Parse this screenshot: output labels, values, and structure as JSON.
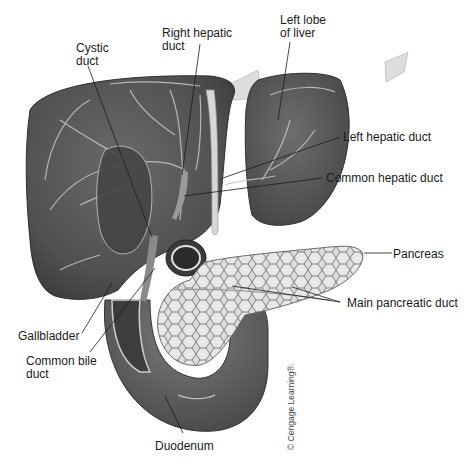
{
  "figure": {
    "colors": {
      "organ_dark": "#4a4a4a",
      "organ_mid": "#5e5e5e",
      "organ_light": "#7a7a7a",
      "vessel": "#cfcfcf",
      "pancreas_fill": "#d9d9d9",
      "pancreas_lobule_edge": "#7c7c7c",
      "leader_line": "#1a1a1a",
      "background": "#ffffff"
    },
    "labels": [
      {
        "id": "cystic-duct",
        "text": "Cystic\nduct"
      },
      {
        "id": "right-hepatic-duct",
        "text": "Right hepatic\nduct"
      },
      {
        "id": "left-lobe-of-liver",
        "text": "Left lobe\nof liver"
      },
      {
        "id": "left-hepatic-duct",
        "text": "Left hepatic duct"
      },
      {
        "id": "common-hepatic-duct",
        "text": "Common hepatic duct"
      },
      {
        "id": "pancreas",
        "text": "Pancreas"
      },
      {
        "id": "main-pancreatic-duct",
        "text": "Main pancreatic duct"
      },
      {
        "id": "gallbladder",
        "text": "Gallbladder"
      },
      {
        "id": "common-bile-duct",
        "text": "Common bile\nduct"
      },
      {
        "id": "duodenum",
        "text": "Duodenum"
      }
    ],
    "copyright": "© Cengage Learning®."
  }
}
